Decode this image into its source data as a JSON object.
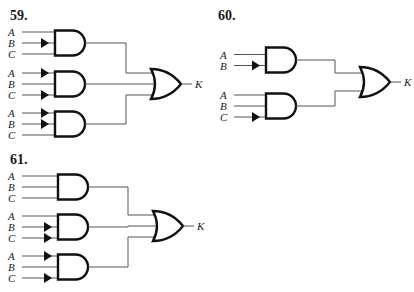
{
  "problems": [
    {
      "number": "59.",
      "output": "K",
      "gates": [
        {
          "type": "AND",
          "inputs": [
            {
              "name": "A",
              "inverted": false
            },
            {
              "name": "B",
              "inverted": true
            },
            {
              "name": "C",
              "inverted": false
            }
          ]
        },
        {
          "type": "AND",
          "inputs": [
            {
              "name": "A",
              "inverted": true
            },
            {
              "name": "B",
              "inverted": false
            },
            {
              "name": "C",
              "inverted": true
            }
          ]
        },
        {
          "type": "AND",
          "inputs": [
            {
              "name": "A",
              "inverted": true
            },
            {
              "name": "B",
              "inverted": true
            },
            {
              "name": "C",
              "inverted": false
            }
          ]
        }
      ],
      "final_gate": "OR"
    },
    {
      "number": "60.",
      "output": "K",
      "gates": [
        {
          "type": "AND",
          "inputs": [
            {
              "name": "A",
              "inverted": false
            },
            {
              "name": "B",
              "inverted": true
            }
          ]
        },
        {
          "type": "AND",
          "inputs": [
            {
              "name": "A",
              "inverted": false
            },
            {
              "name": "B",
              "inverted": false
            },
            {
              "name": "C",
              "inverted": true
            }
          ]
        }
      ],
      "final_gate": "OR"
    },
    {
      "number": "61.",
      "output": "K",
      "gates": [
        {
          "type": "AND",
          "inputs": [
            {
              "name": "A",
              "inverted": false
            },
            {
              "name": "B",
              "inverted": false
            },
            {
              "name": "C",
              "inverted": false
            }
          ]
        },
        {
          "type": "AND",
          "inputs": [
            {
              "name": "A",
              "inverted": false
            },
            {
              "name": "B",
              "inverted": true
            },
            {
              "name": "C",
              "inverted": true
            }
          ]
        },
        {
          "type": "AND",
          "inputs": [
            {
              "name": "A",
              "inverted": true
            },
            {
              "name": "B",
              "inverted": false
            },
            {
              "name": "C",
              "inverted": true
            }
          ]
        }
      ],
      "final_gate": "OR"
    }
  ]
}
